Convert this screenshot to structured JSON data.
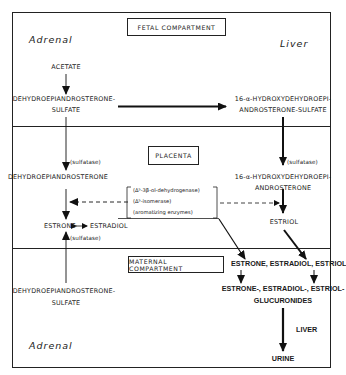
{
  "compartments": {
    "fetal": "FETAL COMPARTMENT",
    "placenta": "PLACENTA",
    "maternal": "MATERNAL COMPARTMENT"
  },
  "organs": {
    "fetal_adrenal": "Adrenal",
    "fetal_liver": "Liver",
    "maternal_adrenal": "Adrenal",
    "maternal_liver": "LIVER"
  },
  "fetal": {
    "acetate": "ACETATE",
    "dheas_line1": "DEHYDROEPIANDROSTERONE-",
    "dheas_line2": "SULFATE",
    "oh_dheas_line1": "16-α-HYDROXYDEHYDROEPI-",
    "oh_dheas_line2": "ANDROSTERONE-SULFATE"
  },
  "placenta": {
    "sulfatase_left": "(sulfatase)",
    "dhea": "DEHYDROEPIANDROSTERONE",
    "sulfatase_right": "(sulfatase)",
    "oh_dhea_line1": "16-α-HYDROXYDEHYDROEPI-",
    "oh_dhea_line2": "ANDROSTERONE",
    "enzymes": [
      "(Δ⁵-3β-ol-dehydrogenase)",
      "(Δ⁵-isomerase)",
      "(aromatizing enzymes)"
    ],
    "estrone": "ESTRONE",
    "estradiol": "ESTRADIOL",
    "sulfatase_bottom": "(sulfatase)",
    "estriol": "ESTRIOL"
  },
  "maternal": {
    "dheas_line1": "DEHYDROEPIANDROSTERONE-",
    "dheas_line2": "SULFATE",
    "estrogens": "ESTRONE, ESTRADIOL, ESTRIOL",
    "glucuronides_line1": "ESTRONE-, ESTRADIOL-, ESTRIOL-",
    "glucuronides_line2": "GLUCURONIDES",
    "urine": "URINE"
  }
}
